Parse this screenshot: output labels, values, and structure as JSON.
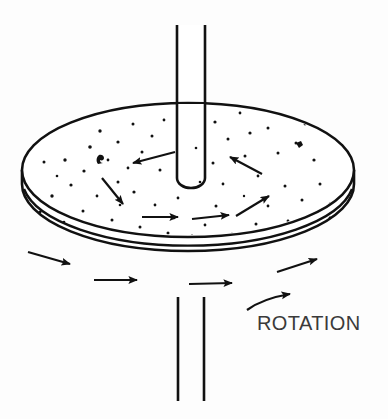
{
  "figure": {
    "type": "technical-line-diagram",
    "title": "",
    "background_color": "#fdfdfd",
    "stroke_color": "#111111",
    "label_color": "#3a3a3a",
    "labels": [
      {
        "name": "rotation-label",
        "text": "ROTATION",
        "x": 257,
        "y": 312,
        "font_size": 20
      }
    ],
    "shaft": {
      "name": "vertical-shaft",
      "color": "#111111",
      "upper": {
        "x_left": 177,
        "x_right": 205,
        "y_top": 25,
        "y_bottom": 186,
        "rounded_bottom": true
      },
      "lower": {
        "x_left": 177,
        "x_right": 205,
        "y_top": 297,
        "y_bottom": 401
      }
    },
    "disk": {
      "name": "rotating-disk",
      "center_x": 188,
      "top_ellipse_cy": 170,
      "rx": 166,
      "ry": 67,
      "thickness": 42,
      "fill": "#ffffff",
      "stroke": "#111111"
    },
    "top_surface_arrows": [
      {
        "name": "flow-arrow-top-left-inward",
        "x1": 175,
        "y1": 152,
        "x2": 131,
        "y2": 164
      },
      {
        "name": "flow-arrow-upper-left-diagonal",
        "x1": 102,
        "y1": 178,
        "x2": 125,
        "y2": 206
      },
      {
        "name": "flow-arrow-center-left-horizontal",
        "x1": 142,
        "y1": 217,
        "x2": 180,
        "y2": 217
      },
      {
        "name": "flow-arrow-center-right-horizontal",
        "x1": 192,
        "y1": 219,
        "x2": 231,
        "y2": 215
      },
      {
        "name": "flow-arrow-right-inward",
        "x1": 262,
        "y1": 174,
        "x2": 228,
        "y2": 156
      },
      {
        "name": "flow-arrow-lower-right-diagonal",
        "x1": 236,
        "y1": 216,
        "x2": 271,
        "y2": 194
      }
    ],
    "rim_arrows": [
      {
        "name": "rim-arrow-left-lower",
        "x1": 28,
        "y1": 253,
        "x2": 73,
        "y2": 266
      },
      {
        "name": "rim-arrow-left-horizontal",
        "x1": 94,
        "y1": 280,
        "x2": 140,
        "y2": 280
      },
      {
        "name": "rim-arrow-center-horizontal",
        "x1": 189,
        "y1": 284,
        "x2": 235,
        "y2": 283
      },
      {
        "name": "rim-arrow-right-upward",
        "x1": 277,
        "y1": 272,
        "x2": 320,
        "y2": 258
      }
    ],
    "rotation_indicator": {
      "name": "rotation-curved-arrow",
      "path_start": {
        "x": 248,
        "y": 309
      },
      "path_end": {
        "x": 294,
        "y": 295
      },
      "direction": "counterclockwise-viewed-from-above"
    },
    "speckles": {
      "name": "surface-speckle-texture",
      "count_top": 58,
      "count_rim": 20,
      "color": "#111111"
    }
  }
}
